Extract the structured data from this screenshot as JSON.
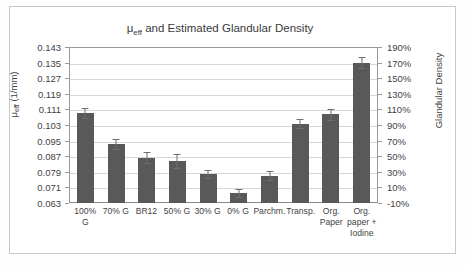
{
  "figure": {
    "title_prefix": "μ",
    "title_sub": "eff",
    "title_rest": " and Estimated Glandular Density",
    "bar_color": "#595959",
    "error_color": "#6e6e6e",
    "grid_color": "#d7d7d7",
    "axis_color": "#9a9a9a"
  },
  "axes": {
    "left_title_prefix": "μ",
    "left_title_sub": "eff",
    "left_title_rest": " (1/mm)",
    "right_title": "Glandular Density",
    "left_ticks": [
      "0.143",
      "0.135",
      "0.127",
      "0.119",
      "0.111",
      "0.103",
      "0.095",
      "0.087",
      "0.079",
      "0.071",
      "0.063"
    ],
    "right_ticks": [
      "190%",
      "170%",
      "150%",
      "130%",
      "110%",
      "90%",
      "70%",
      "50%",
      "30%",
      "10%",
      "-10%"
    ]
  },
  "chart_data": {
    "type": "bar",
    "title": "μeff and Estimated Glandular Density",
    "xlabel": "",
    "ylabel": "μeff (1/mm)",
    "y2label": "Glandular Density",
    "ylim": [
      0.063,
      0.143
    ],
    "y2lim": [
      -10,
      190
    ],
    "ytick_step": 0.008,
    "y2tick_step": 20,
    "grid": true,
    "legend": "none",
    "categories": [
      "100% G",
      "70% G",
      "BR12",
      "50% G",
      "30% G",
      "0% G",
      "Parchm.",
      "Transp.",
      "Org. Paper",
      "Org. paper + Iodine"
    ],
    "category_lines": [
      [
        "100% G"
      ],
      [
        "70% G"
      ],
      [
        "BR12"
      ],
      [
        "50% G"
      ],
      [
        "30% G"
      ],
      [
        "0% G"
      ],
      [
        "Parchm."
      ],
      [
        "Transp."
      ],
      [
        "Org.",
        "Paper"
      ],
      [
        "Org.",
        "paper +",
        "Iodine"
      ]
    ],
    "values": [
      0.1092,
      0.0932,
      0.0862,
      0.0845,
      0.0777,
      0.0683,
      0.0771,
      0.1037,
      0.1086,
      0.135
    ],
    "errors": [
      0.0025,
      0.0025,
      0.0028,
      0.0035,
      0.002,
      0.002,
      0.0022,
      0.0022,
      0.0028,
      0.003
    ],
    "glandular_density_percent": [
      105,
      65,
      47,
      43,
      26,
      3,
      25,
      93,
      104,
      172
    ],
    "series": [
      {
        "name": "μeff (1/mm)",
        "values": [
          0.1092,
          0.0932,
          0.0862,
          0.0845,
          0.0777,
          0.0683,
          0.0771,
          0.1037,
          0.1086,
          0.135
        ]
      }
    ]
  }
}
